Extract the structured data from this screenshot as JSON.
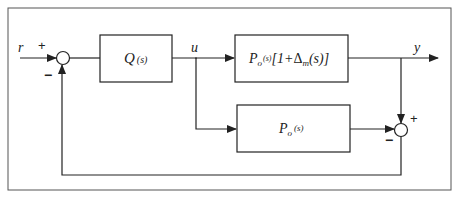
{
  "diagram": {
    "type": "feedback-control-block-diagram",
    "signals": {
      "reference": "r",
      "control": "u",
      "output": "y"
    },
    "blocks": {
      "controller": {
        "name": "Q",
        "arg": "(s)"
      },
      "plant": {
        "name": "P",
        "sub": "o",
        "arg": "(s)",
        "bracket_open": "[",
        "one_plus": "1+",
        "delta": "Δ",
        "delta_sub": "m",
        "delta_arg": "(s)",
        "bracket_close": "]"
      },
      "model": {
        "name": "P",
        "sub": "o",
        "arg": "(s)"
      }
    },
    "junctions": {
      "input_sum": {
        "plus": "+",
        "minus": "−"
      },
      "error_sum": {
        "plus": "+",
        "minus": "−"
      }
    },
    "colors": {
      "line": "#222222",
      "frame": "#555555",
      "background": "#ffffff"
    }
  }
}
